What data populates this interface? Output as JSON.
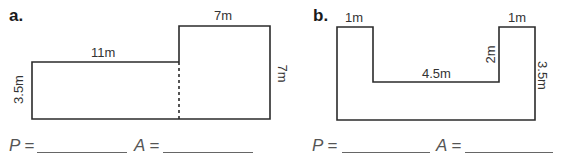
{
  "problems": [
    {
      "letter": "a.",
      "shape": "L-shape (two rectangles joined, dashed divider)",
      "labels": {
        "top_left_width": "11m",
        "top_right_width": "7m",
        "left_height": "3.5m",
        "right_height": "7m"
      },
      "answer": {
        "p_label": "P",
        "a_label": "A",
        "equals": "=",
        "p_value": "",
        "a_value": ""
      }
    },
    {
      "letter": "b.",
      "shape": "U-shape",
      "labels": {
        "left_top_width": "1m",
        "right_top_width": "1m",
        "inner_width": "4.5m",
        "inner_height": "2m",
        "right_height": "3.5m"
      },
      "answer": {
        "p_label": "P",
        "a_label": "A",
        "equals": "=",
        "p_value": "",
        "a_value": ""
      }
    }
  ],
  "colors": {
    "stroke": "#2b2b2b",
    "text": "#333333",
    "blank_line": "#666666"
  }
}
